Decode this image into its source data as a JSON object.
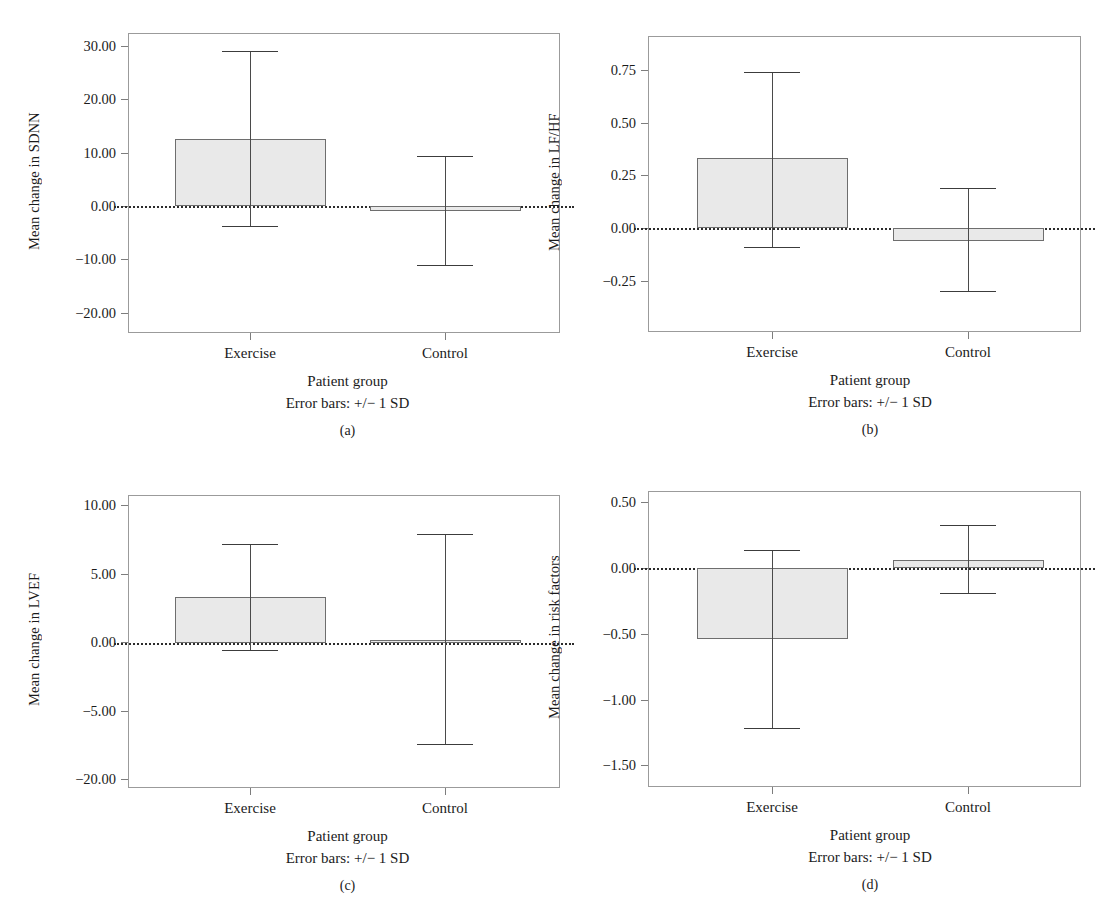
{
  "figure": {
    "xlabel": "Patient group",
    "errnote": "Error bars: +/− 1 SD",
    "categories": [
      "Exercise",
      "Control"
    ]
  },
  "panels": [
    {
      "caption": "(a)",
      "ylabel": "Mean change in SDNN",
      "yticks": [
        "30.00",
        "20.00",
        "10.00",
        "0.00",
        "−10.00",
        "−20.00"
      ],
      "bars": [
        {
          "cat": "Exercise",
          "mean": "12.6",
          "err_hi": "29.0",
          "err_lo": "−3.7"
        },
        {
          "cat": "Control",
          "mean": "−0.9",
          "err_hi": "9.3",
          "err_lo": "−11.1"
        }
      ]
    },
    {
      "caption": "(b)",
      "ylabel": "Mean change in LF/HF",
      "yticks": [
        "0.75",
        "0.50",
        "0.25",
        "0.00",
        "−0.25"
      ],
      "bars": [
        {
          "cat": "Exercise",
          "mean": "0.33",
          "err_hi": "0.74",
          "err_lo": "−0.09"
        },
        {
          "cat": "Control",
          "mean": "−0.06",
          "err_hi": "0.19",
          "err_lo": "−0.30"
        }
      ]
    },
    {
      "caption": "(c)",
      "ylabel": "Mean change in LVEF",
      "yticks": [
        "10.00",
        "5.00",
        "0.00",
        "−5.00",
        "−20.00"
      ],
      "bars": [
        {
          "cat": "Exercise",
          "mean": "3.4",
          "err_hi": "7.3",
          "err_lo": "−0.5"
        },
        {
          "cat": "Control",
          "mean": "0.25",
          "err_hi": "8.0",
          "err_lo": "−7.4"
        }
      ]
    },
    {
      "caption": "(d)",
      "ylabel": "Mean change in risk factors",
      "yticks": [
        "0.50",
        "0.00",
        "−0.50",
        "−1.00",
        "−1.50"
      ],
      "bars": [
        {
          "cat": "Exercise",
          "mean": "−0.54",
          "err_hi": "0.14",
          "err_lo": "−1.22"
        },
        {
          "cat": "Control",
          "mean": "0.06",
          "err_hi": "0.33",
          "err_lo": "−0.19"
        }
      ]
    }
  ],
  "chart_data": {
    "type": "bar",
    "title": "",
    "xlabel": "Patient group",
    "annotations": [
      "Error bars: +/− 1 SD"
    ],
    "grid": false,
    "legend": "none",
    "categories": [
      "Exercise",
      "Control"
    ],
    "subplots": [
      {
        "label": "(a)",
        "ylabel": "Mean change in SDNN",
        "ylim": [
          -20.0,
          30.0
        ],
        "yticks": [
          30.0,
          20.0,
          10.0,
          0.0,
          -10.0,
          -20.0
        ],
        "values": [
          12.6,
          -0.9
        ],
        "error_upper": [
          29.0,
          9.3
        ],
        "error_lower": [
          -3.7,
          -11.1
        ]
      },
      {
        "label": "(b)",
        "ylabel": "Mean change in LF/HF",
        "ylim": [
          -0.25,
          0.75
        ],
        "yticks": [
          0.75,
          0.5,
          0.25,
          0.0,
          -0.25
        ],
        "values": [
          0.33,
          -0.06
        ],
        "error_upper": [
          0.74,
          0.19
        ],
        "error_lower": [
          -0.09,
          -0.3
        ]
      },
      {
        "label": "(c)",
        "ylabel": "Mean change in LVEF",
        "ylim": [
          -10.0,
          10.0
        ],
        "yticks": [
          10.0,
          5.0,
          0.0,
          -5.0,
          -20.0
        ],
        "ytick_note": "bottom tick printed as -20.00 in source figure",
        "values": [
          3.4,
          0.25
        ],
        "error_upper": [
          7.3,
          8.0
        ],
        "error_lower": [
          -0.5,
          -7.4
        ]
      },
      {
        "label": "(d)",
        "ylabel": "Mean change in risk factors",
        "ylim": [
          -1.5,
          0.5
        ],
        "yticks": [
          0.5,
          0.0,
          -0.5,
          -1.0,
          -1.5
        ],
        "values": [
          -0.54,
          0.06
        ],
        "error_upper": [
          0.14,
          0.33
        ],
        "error_lower": [
          -1.22,
          -0.19
        ]
      }
    ]
  }
}
